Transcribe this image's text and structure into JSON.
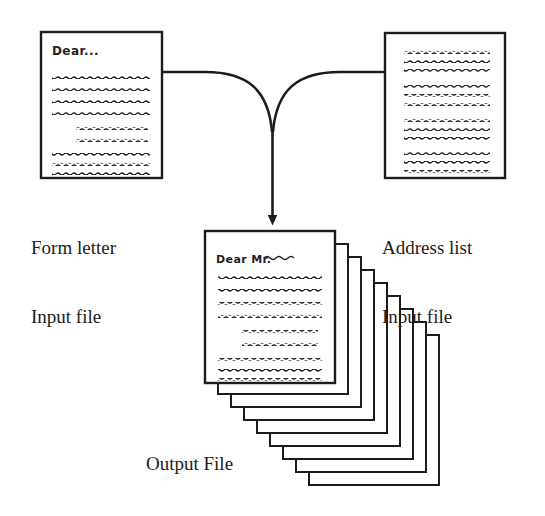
{
  "diagram": {
    "type": "flow",
    "background_color": "#ffffff",
    "ink_color": "#1c1c1c"
  },
  "nodes": {
    "form_letter": {
      "id": "form-letter-page",
      "label_line1": "Form letter",
      "label_line2": "Input file",
      "heading_text": "Dear...",
      "body_lines": [
        {
          "indent": 0,
          "width": 100
        },
        {
          "indent": 0,
          "width": 100
        },
        {
          "indent": 0,
          "width": 100
        },
        {
          "indent": 0,
          "width": 100
        },
        {
          "indent": 28,
          "width": 72
        },
        {
          "indent": 28,
          "width": 72
        },
        {
          "indent": 0,
          "width": 100
        },
        {
          "indent": 0,
          "width": 100
        },
        {
          "indent": 0,
          "width": 100
        }
      ]
    },
    "address_list": {
      "id": "address-list-page",
      "label_line1": "Address list",
      "label_line2": "Input file",
      "heading_text": "",
      "body_groups": [
        [
          {
            "width": 100
          },
          {
            "width": 100
          },
          {
            "width": 100
          }
        ],
        [
          {
            "width": 100
          },
          {
            "width": 100
          },
          {
            "width": 100
          }
        ],
        [
          {
            "width": 100
          },
          {
            "width": 100
          },
          {
            "width": 100
          }
        ],
        [
          {
            "width": 100
          },
          {
            "width": 100
          },
          {
            "width": 100
          }
        ]
      ]
    },
    "output": {
      "id": "output-file-stack",
      "label": "Output File",
      "heading_text": "Dear Mr.",
      "heading_has_squiggle": true,
      "stack_count": 9,
      "stack_offset_x": 13,
      "stack_offset_y": 13,
      "body_lines": [
        {
          "indent": 0,
          "width": 100
        },
        {
          "indent": 0,
          "width": 100
        },
        {
          "indent": 0,
          "width": 100
        },
        {
          "indent": 0,
          "width": 100
        },
        {
          "indent": 28,
          "width": 72
        },
        {
          "indent": 28,
          "width": 72
        },
        {
          "indent": 0,
          "width": 100
        },
        {
          "indent": 0,
          "width": 100
        },
        {
          "indent": 0,
          "width": 100
        }
      ]
    }
  },
  "connector": {
    "id": "merge-arrow",
    "shape": "y-merge",
    "direction": "down",
    "arrowhead": "filled-triangle",
    "from": [
      "form-letter-page",
      "address-list-page"
    ],
    "to": "output-file-stack"
  }
}
